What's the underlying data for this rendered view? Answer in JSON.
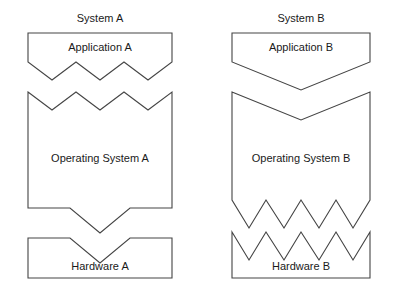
{
  "diagram": {
    "title_hidden": "",
    "systems": [
      {
        "name": "system-a",
        "title": "System A",
        "layers": [
          {
            "key": "application",
            "label": "Application A",
            "bottom_interface": "zigzag-3-tooth"
          },
          {
            "key": "operating_system",
            "label": "Operating System A",
            "top_interface": "zigzag-3-tooth",
            "bottom_interface": "v-notch-wide"
          },
          {
            "key": "hardware",
            "label": "Hardware A",
            "top_interface": "v-notch-wide"
          }
        ]
      },
      {
        "name": "system-b",
        "title": "System B",
        "layers": [
          {
            "key": "application",
            "label": "Application B",
            "bottom_interface": "v-notch-broad"
          },
          {
            "key": "operating_system",
            "label": "Operating System B",
            "top_interface": "v-notch-broad",
            "bottom_interface": "sawtooth-4-tooth"
          },
          {
            "key": "hardware",
            "label": "Hardware B",
            "top_interface": "sawtooth-4-tooth"
          }
        ]
      }
    ]
  },
  "colors": {
    "background": "#ffffff",
    "stroke": "#444444",
    "text": "#1a1a1a"
  }
}
